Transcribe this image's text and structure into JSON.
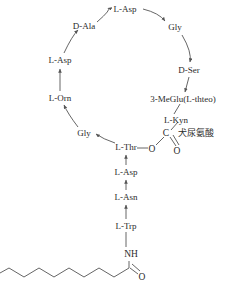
{
  "diagram": {
    "type": "chemical-structure",
    "stroke_color": "#555555",
    "text_color": "#2b2b2b",
    "macrocycle_residues": [
      {
        "id": "l-asp-top",
        "label": "L-Asp",
        "x": 125,
        "y": 9
      },
      {
        "id": "d-ala",
        "label": "D-Ala",
        "x": 84,
        "y": 26
      },
      {
        "id": "l-asp-left",
        "label": "L-Asp",
        "x": 60,
        "y": 60
      },
      {
        "id": "l-orn",
        "label": "L-Orn",
        "x": 60,
        "y": 98
      },
      {
        "id": "gly-left",
        "label": "Gly",
        "x": 84,
        "y": 133
      },
      {
        "id": "l-thr",
        "label": "L-Thr",
        "x": 126,
        "y": 147
      },
      {
        "id": "gly-right",
        "label": "Gly",
        "x": 175,
        "y": 27
      },
      {
        "id": "d-ser",
        "label": "D-Ser",
        "x": 189,
        "y": 70
      },
      {
        "id": "3-meglu",
        "label": "3-MeGlu(L-thteo)",
        "x": 183,
        "y": 99
      }
    ],
    "tail_residues": [
      {
        "id": "l-asp-tail",
        "label": "L-Asp",
        "x": 126,
        "y": 172
      },
      {
        "id": "l-asn",
        "label": "L-Asn",
        "x": 126,
        "y": 197
      },
      {
        "id": "l-trp",
        "label": "L-Trp",
        "x": 126,
        "y": 226
      }
    ],
    "ester_group": {
      "kyn_label": "L-Kyn",
      "kyn_x": 176,
      "kyn_y": 120,
      "kyn_cn_label": "犬尿氨酸",
      "kyn_cn_x": 196,
      "kyn_cn_y": 133,
      "carbon_label": "C",
      "carbon_x": 166,
      "carbon_y": 133,
      "ester_oxygen_label": "O",
      "ester_oxygen_x": 152,
      "ester_oxygen_y": 149,
      "carbonyl_oxygen_label": "O",
      "carbonyl_oxygen_x": 177,
      "carbonyl_oxygen_y": 151
    },
    "lipid_tail": {
      "amide_label": "NH",
      "amide_x": 131,
      "amide_y": 254,
      "carbonyl_oxygen_label": "O",
      "carbonyl_oxygen_x": 142,
      "carbonyl_oxygen_y": 277,
      "chain_description": "decanoyl zigzag chain"
    }
  }
}
